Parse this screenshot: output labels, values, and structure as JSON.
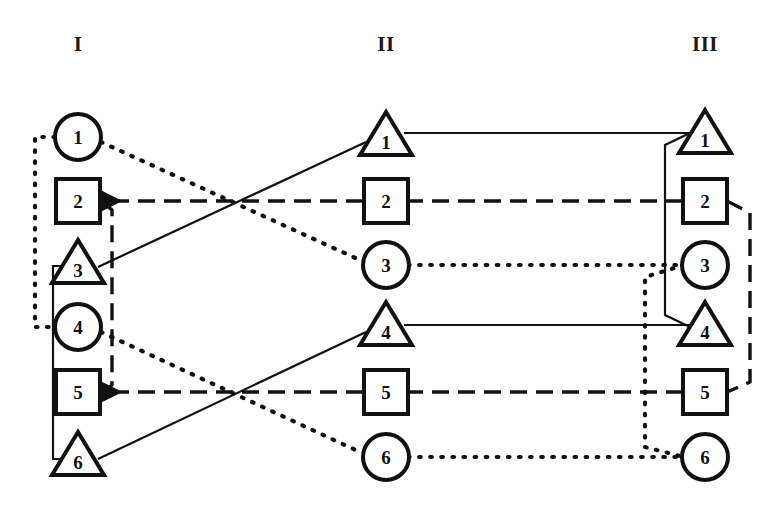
{
  "figure": {
    "title": "",
    "background": "#ffffff",
    "ink": "#111111",
    "width": 777,
    "height": 510
  },
  "columns": [
    {
      "id": "I",
      "header": "I",
      "x": 78,
      "header_x": 78,
      "header_y": 45
    },
    {
      "id": "II",
      "header": "II",
      "x": 386,
      "header_x": 386,
      "header_y": 45
    },
    {
      "id": "III",
      "header": "III",
      "x": 705,
      "header_x": 705,
      "header_y": 45
    }
  ],
  "row_y": [
    137,
    201,
    265,
    327,
    392,
    457
  ],
  "nodes": {
    "I": [
      {
        "label": "1",
        "shape": "circle",
        "x": 78,
        "y": 137
      },
      {
        "label": "2",
        "shape": "square",
        "x": 78,
        "y": 201
      },
      {
        "label": "3",
        "shape": "triangle",
        "x": 78,
        "y": 265
      },
      {
        "label": "4",
        "shape": "circle",
        "x": 78,
        "y": 327
      },
      {
        "label": "5",
        "shape": "square",
        "x": 78,
        "y": 392
      },
      {
        "label": "6",
        "shape": "triangle",
        "x": 78,
        "y": 457
      }
    ],
    "II": [
      {
        "label": "1",
        "shape": "triangle",
        "x": 386,
        "y": 137
      },
      {
        "label": "2",
        "shape": "square",
        "x": 386,
        "y": 201
      },
      {
        "label": "3",
        "shape": "circle",
        "x": 386,
        "y": 265
      },
      {
        "label": "4",
        "shape": "triangle",
        "x": 386,
        "y": 327
      },
      {
        "label": "5",
        "shape": "square",
        "x": 386,
        "y": 392
      },
      {
        "label": "6",
        "shape": "circle",
        "x": 386,
        "y": 457
      }
    ],
    "III": [
      {
        "label": "1",
        "shape": "triangle",
        "x": 705,
        "y": 135
      },
      {
        "label": "2",
        "shape": "square",
        "x": 705,
        "y": 201
      },
      {
        "label": "3",
        "shape": "circle",
        "x": 705,
        "y": 265
      },
      {
        "label": "4",
        "shape": "triangle",
        "x": 705,
        "y": 327
      },
      {
        "label": "5",
        "shape": "square",
        "x": 705,
        "y": 392
      },
      {
        "label": "6",
        "shape": "circle",
        "x": 705,
        "y": 457
      }
    ]
  },
  "line_styles": {
    "solid": {
      "name": "solid",
      "dasharray": "",
      "width": 2.2
    },
    "dashed": {
      "name": "dashed",
      "dasharray": "17 9",
      "width": 3.4
    },
    "dotted": {
      "name": "dotted",
      "dasharray": "1.6 9.5",
      "width": 4.2
    }
  },
  "edges_I_to_II": [
    {
      "from": "I-1",
      "to": "II-3",
      "style": "dotted"
    },
    {
      "from": "I-2",
      "to": "II-2",
      "style": "dashed",
      "arrow": "to-left"
    },
    {
      "from": "I-3",
      "to": "II-1",
      "style": "solid"
    },
    {
      "from": "I-4",
      "to": "II-6",
      "style": "dotted"
    },
    {
      "from": "I-5",
      "to": "II-5",
      "style": "dashed",
      "arrow": "to-left"
    },
    {
      "from": "I-6",
      "to": "II-4",
      "style": "solid"
    }
  ],
  "edges_II_to_III": [
    {
      "from": "II-1",
      "to": "III-1",
      "style": "solid"
    },
    {
      "from": "II-2",
      "to": "III-2",
      "style": "dashed"
    },
    {
      "from": "II-3",
      "to": "III-3",
      "style": "dotted"
    },
    {
      "from": "II-4",
      "to": "III-4",
      "style": "solid"
    },
    {
      "from": "II-5",
      "to": "III-5",
      "style": "dashed"
    },
    {
      "from": "II-6",
      "to": "III-6",
      "style": "dotted"
    }
  ],
  "column_I_connectors": [
    {
      "name": "dotted-vertical-1-to-4",
      "style": "dotted",
      "connects": [
        "I-1",
        "I-4"
      ],
      "side": "left",
      "bus_x": 35
    },
    {
      "name": "solid-vertical-3-to-6",
      "style": "solid",
      "connects": [
        "I-3",
        "I-6"
      ],
      "side": "left",
      "bus_x": 53
    },
    {
      "name": "dashed-vertical-2-to-5",
      "style": "dashed",
      "connects": [
        "I-2",
        "I-5"
      ],
      "side": "right",
      "bus_x": 112
    }
  ],
  "column_III_connectors": [
    {
      "name": "solid-vertical-1-to-4",
      "style": "solid",
      "connects": [
        "III-1",
        "III-4"
      ],
      "side": "left",
      "bus_x": 665
    },
    {
      "name": "dotted-vertical-3-to-6",
      "style": "dotted",
      "connects": [
        "III-3",
        "III-6"
      ],
      "side": "left",
      "bus_x": 645
    },
    {
      "name": "dashed-vertical-2-to-5",
      "style": "dashed",
      "connects": [
        "III-2",
        "III-5"
      ],
      "side": "right",
      "bus_x": 750
    }
  ],
  "legend_note": ""
}
